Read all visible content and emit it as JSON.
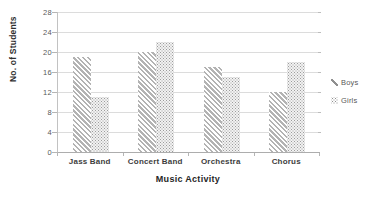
{
  "chart_data": {
    "type": "bar",
    "title": "",
    "xlabel": "Music Activity",
    "ylabel": "No. of Students",
    "categories": [
      "Jass Band",
      "Concert Band",
      "Orchestra",
      "Chorus"
    ],
    "series": [
      {
        "name": "Boys",
        "pattern": "diagonal-stripes",
        "color": "#b3b3b3",
        "values": [
          19,
          20,
          17,
          12
        ]
      },
      {
        "name": "Girls",
        "pattern": "dots",
        "color": "#9c9c9c",
        "values": [
          11,
          22,
          15,
          18
        ]
      }
    ],
    "ylim": [
      0,
      28
    ],
    "yticks": [
      0,
      4,
      8,
      12,
      16,
      20,
      24,
      28
    ],
    "grid": true,
    "legend_position": "right"
  },
  "colors": {
    "background": "#ffffff",
    "gridline": "#dcdcdc",
    "axis_line": "#b5b5b5",
    "tick_label": "#595959",
    "category_label": "#3d3d3d",
    "axis_title": "#262626",
    "legend_text": "#595959"
  }
}
